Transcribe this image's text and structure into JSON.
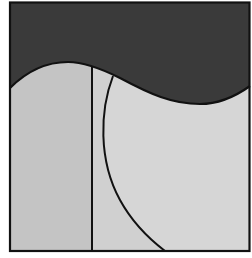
{
  "diagram": {
    "colors": {
      "background": "#ffffff",
      "dark_region": "#3a3a3a",
      "left_region": "#c4c4c4",
      "middle_region": "#d0d0d0",
      "right_region": "#d6d6d6",
      "stroke": "#111111"
    },
    "regions": [
      {
        "id": "top-dark",
        "label": ""
      },
      {
        "id": "lower-left",
        "label": ""
      },
      {
        "id": "lower-middle",
        "label": ""
      },
      {
        "id": "lower-right",
        "label": ""
      }
    ]
  }
}
